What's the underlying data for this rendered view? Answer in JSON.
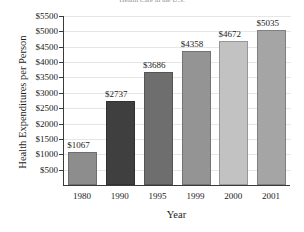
{
  "chart_data": {
    "type": "bar",
    "title": "Health Care in the U.S.",
    "title_truncated": true,
    "xlabel": "Year",
    "ylabel": "Health Expenditures per Person",
    "categories": [
      "1980",
      "1990",
      "1995",
      "1999",
      "2000",
      "2001"
    ],
    "values": [
      1067,
      2737,
      3686,
      4358,
      4672,
      5035
    ],
    "value_labels": [
      "$1067",
      "$2737",
      "$3686",
      "$4358",
      "$4672",
      "$5035"
    ],
    "ylim": [
      0,
      5500
    ],
    "ytick_values": [
      500,
      1000,
      1500,
      2000,
      2500,
      3000,
      3500,
      4000,
      4500,
      5000,
      5500
    ],
    "ytick_labels": [
      "$500",
      "$1000",
      "$1500",
      "$2000",
      "$2500",
      "$3000",
      "$3500",
      "$4000",
      "$4500",
      "$5000",
      "$5500"
    ],
    "grid": "horizontal",
    "legend": "none",
    "bar_colors": [
      "#8d8d8d",
      "#3f3f3f",
      "#6e6e6e",
      "#949494",
      "#c2c2c2",
      "#a5a5a5"
    ],
    "axis_color": "#3a3a3a",
    "gridline_color": "#e6e6e6",
    "background_color": "#ffffff"
  }
}
